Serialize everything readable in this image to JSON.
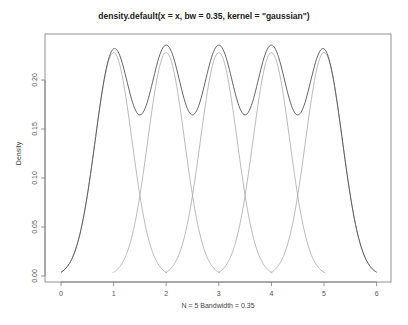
{
  "chart_data": {
    "type": "line",
    "title": "density.default(x = x, bw = 0.35, kernel = \"gaussian\")",
    "xlabel": "N = 5   Bandwidth = 0.35",
    "ylabel": "Density",
    "x_ticks": [
      0,
      1,
      2,
      3,
      4,
      5,
      6
    ],
    "y_ticks": [
      "0.00",
      "0.05",
      "0.10",
      "0.15",
      "0.20"
    ],
    "xlim": [
      -0.3,
      6.3
    ],
    "ylim": [
      0,
      0.24
    ],
    "data_points": [
      1,
      2,
      3,
      4,
      5
    ],
    "bandwidth": 0.35,
    "kernel": "gaussian",
    "grid": false,
    "series": [
      {
        "name": "density",
        "color": "#555555",
        "description": "total kernel density estimate",
        "peak_values": [
          0.2325,
          0.2354,
          0.2355,
          0.2354,
          0.2325
        ],
        "valley_values": [
          0.165,
          0.166,
          0.166,
          0.165
        ]
      },
      {
        "name": "kernel components",
        "color": "#aaaaaa",
        "description": "individual gaussian kernels scaled by 1/N, each peaking at 0.228"
      }
    ],
    "curve_range": [
      0,
      6
    ]
  }
}
